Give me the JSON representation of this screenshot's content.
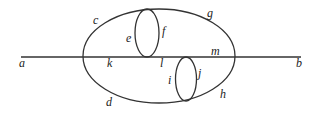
{
  "diagram": {
    "stroke_color": "#333333",
    "labels": {
      "a": "a",
      "b": "b",
      "c": "c",
      "d": "d",
      "e": "e",
      "f": "f",
      "g": "g",
      "h": "h",
      "i": "i",
      "j": "j",
      "k": "k",
      "l": "l",
      "m": "m"
    }
  }
}
